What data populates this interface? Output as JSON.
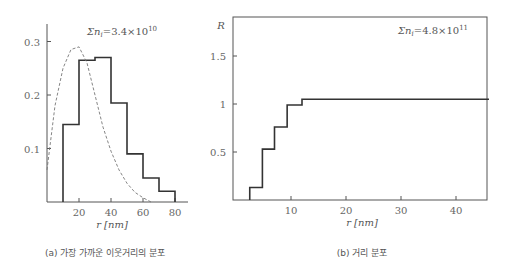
{
  "chart_data": [
    {
      "type": "bar",
      "title": "(a) 가장 가까운 이웃거리의 분포",
      "annotation": "Σn_i = 3.4×10^10",
      "annotation_parts": {
        "base": "Σn",
        "sub": "i",
        "eq": "=3.4×10",
        "sup": "10"
      },
      "xlabel": "r [nm]",
      "ylabel": "",
      "xlim": [
        0,
        90
      ],
      "ylim": [
        0,
        0.33
      ],
      "x_ticks": [
        20,
        40,
        60,
        80
      ],
      "y_ticks": [
        0.1,
        0.2,
        0.3
      ],
      "x_tick_labels": [
        "20",
        "40",
        "60",
        "80"
      ],
      "y_tick_labels": [
        "0.1",
        "0.2",
        "0.3"
      ],
      "bins": [
        [
          10,
          20
        ],
        [
          20,
          30
        ],
        [
          30,
          40
        ],
        [
          40,
          50
        ],
        [
          50,
          60
        ],
        [
          60,
          70
        ],
        [
          70,
          80
        ]
      ],
      "values": [
        0.145,
        0.265,
        0.27,
        0.185,
        0.09,
        0.045,
        0.02
      ],
      "series": [
        {
          "name": "histogram",
          "style": "solid-step",
          "x": [
            10,
            20,
            30,
            40,
            50,
            60,
            70,
            80
          ],
          "values": [
            0.145,
            0.265,
            0.27,
            0.185,
            0.09,
            0.045,
            0.02
          ]
        },
        {
          "name": "theoretical",
          "style": "dashed",
          "x": [
            0,
            5,
            10,
            15,
            20,
            25,
            30,
            35,
            40,
            45,
            50,
            55,
            60,
            65
          ],
          "values": [
            0.06,
            0.18,
            0.25,
            0.285,
            0.29,
            0.26,
            0.2,
            0.14,
            0.095,
            0.06,
            0.035,
            0.018,
            0.008,
            0.0
          ]
        }
      ],
      "grid": false
    },
    {
      "type": "line",
      "title": "(b) 거리 분포",
      "annotation": "Σn_i = 4.8×10^11",
      "annotation_parts": {
        "base": "Σn",
        "sub": "i",
        "eq": "=4.8×10",
        "sup": "11"
      },
      "xlabel": "r [nm]",
      "ylabel": "R",
      "xlim": [
        0,
        46
      ],
      "ylim": [
        0,
        1.9
      ],
      "x_ticks": [
        10,
        20,
        30,
        40
      ],
      "y_ticks": [
        0.5,
        1,
        1.5
      ],
      "x_tick_labels": [
        "10",
        "20",
        "30",
        "40"
      ],
      "y_tick_labels": [
        "0.5",
        "1",
        "1.5"
      ],
      "series": [
        {
          "name": "R(r)",
          "style": "solid-step",
          "x": [
            2.5,
            4.8,
            7.0,
            9.3,
            12.0,
            46
          ],
          "values": [
            0.13,
            0.53,
            0.76,
            0.99,
            1.05,
            1.05
          ]
        }
      ],
      "grid": false,
      "frame": true
    }
  ],
  "captions": {
    "a": "(a) 가장 가까운 이웃거리의 분포",
    "b": "(b) 거리 분포"
  }
}
